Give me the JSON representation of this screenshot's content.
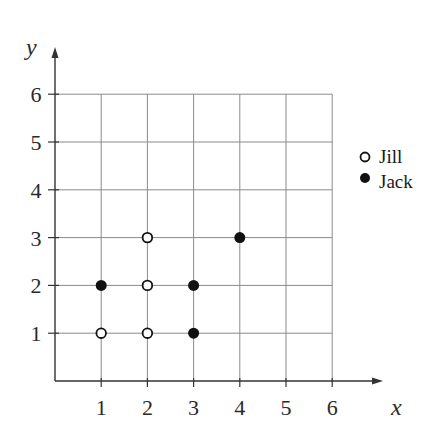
{
  "chart_data": {
    "type": "scatter",
    "title": "",
    "xlabel": "x",
    "ylabel": "y",
    "xlim": [
      0,
      6
    ],
    "ylim": [
      0,
      6
    ],
    "xticks": [
      1,
      2,
      3,
      4,
      5,
      6
    ],
    "yticks": [
      1,
      2,
      3,
      4,
      5,
      6
    ],
    "grid": true,
    "legend_position": "right",
    "series": [
      {
        "name": "Jill",
        "marker": "open-circle",
        "points": [
          [
            1,
            1
          ],
          [
            2,
            1
          ],
          [
            2,
            2
          ],
          [
            2,
            3
          ]
        ]
      },
      {
        "name": "Jack",
        "marker": "filled-circle",
        "points": [
          [
            1,
            2
          ],
          [
            3,
            1
          ],
          [
            3,
            2
          ],
          [
            4,
            3
          ]
        ]
      }
    ]
  },
  "legend": {
    "items": [
      {
        "label": "Jill",
        "marker": "open-circle"
      },
      {
        "label": "Jack",
        "marker": "filled-circle"
      }
    ]
  },
  "axes": {
    "x_label": "x",
    "y_label": "y",
    "x_ticks": [
      "1",
      "2",
      "3",
      "4",
      "5",
      "6"
    ],
    "y_ticks": [
      "1",
      "2",
      "3",
      "4",
      "5",
      "6"
    ]
  },
  "colors": {
    "axis": "#333333",
    "grid": "#8a8a8a",
    "marker": "#111111",
    "background": "#ffffff"
  }
}
